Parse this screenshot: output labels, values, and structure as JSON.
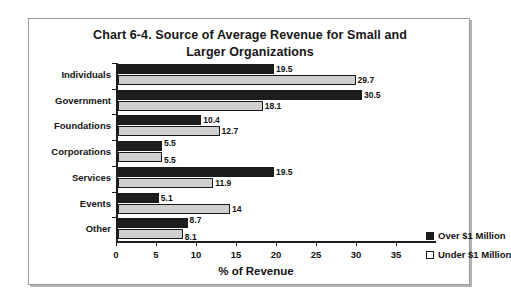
{
  "chart_data": {
    "type": "bar",
    "orientation": "horizontal",
    "title": "Chart 6-4.  Source of Average Revenue for Small and Larger Organizations",
    "title_line1": "Chart 6-4.  Source of Average Revenue for Small and",
    "title_line2": "Larger Organizations",
    "xlabel": "% of Revenue",
    "ylabel": "",
    "xlim": [
      0,
      35
    ],
    "xticks": [
      0,
      5,
      10,
      15,
      20,
      25,
      30,
      35
    ],
    "xtick_labels": [
      "0",
      "5",
      "10",
      "15",
      "20",
      "25",
      "30",
      "35"
    ],
    "grid": false,
    "legend_position": "center-right",
    "categories": [
      "Individuals",
      "Government",
      "Foundations",
      "Corporations",
      "Services",
      "Events",
      "Other"
    ],
    "series": [
      {
        "name": "Over $1 Million",
        "color": "#1d1d1d",
        "values": [
          19.5,
          30.5,
          10.4,
          5.5,
          19.5,
          5.1,
          8.7
        ],
        "labels": [
          "19.5",
          "30.5",
          "10.4",
          "5.5",
          "19.5",
          "5.1",
          "8.7"
        ]
      },
      {
        "name": "Under $1 Million",
        "color": "#cfcfcf",
        "values": [
          29.7,
          18.1,
          12.7,
          5.5,
          11.9,
          14,
          8.1
        ],
        "labels": [
          "29.7",
          "18.1",
          "12.7",
          "5.5",
          "11.9",
          "14",
          "8.1"
        ]
      }
    ]
  },
  "legend": {
    "entries": [
      {
        "label": "Over $1 Million"
      },
      {
        "label": "Under $1 Million"
      }
    ]
  }
}
